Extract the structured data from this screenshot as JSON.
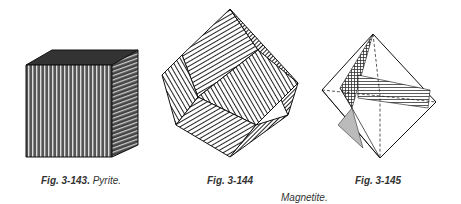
{
  "figures": [
    {
      "id": "fig-3-143",
      "label": "Fig. 3-143.",
      "caption": "Pyrite.",
      "subject": "pyrite-cube-striated"
    },
    {
      "id": "fig-3-144",
      "label": "Fig. 3-144",
      "caption": "",
      "subject": "magnetite-dodecahedron-striated"
    },
    {
      "id": "fig-3-145",
      "label": "Fig. 3-145",
      "caption": "",
      "subject": "magnetite-octahedron"
    }
  ],
  "shared_caption": "Magnetite."
}
